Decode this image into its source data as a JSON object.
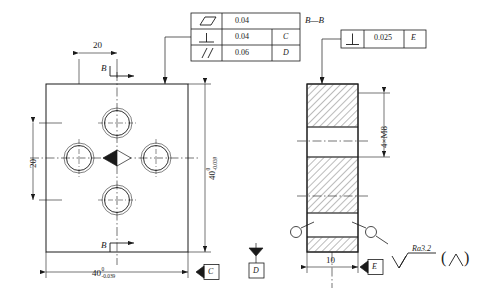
{
  "drawing": {
    "title": "Plate with 4 threaded holes - GD&T detail",
    "line_color": "#1a1a1a",
    "hatch_color": "#1a1a1a"
  },
  "gdt_table": {
    "rows": [
      {
        "symbol": "flatness-parallelogram",
        "tolerance": "0.04",
        "datum": ""
      },
      {
        "symbol": "perpendicularity",
        "tolerance": "0.04",
        "datum": "C"
      },
      {
        "symbol": "parallelism",
        "tolerance": "0.06",
        "datum": "D"
      }
    ]
  },
  "section_frame": {
    "label": "B—B",
    "symbol": "perpendicularity",
    "tolerance": "0.025",
    "datum": "E"
  },
  "front_view": {
    "dim_top": "20",
    "dim_left": "20",
    "dim_right_value": "40",
    "dim_right_upper": "0",
    "dim_right_lower": "-0.039",
    "dim_bottom_value": "40",
    "dim_bottom_upper": "0",
    "dim_bottom_lower": "-0.039",
    "section_mark_top": "B",
    "section_mark_bottom": "B",
    "datum_bottom_right": "D",
    "datum_bottom": "C"
  },
  "section_view": {
    "thread_callout": "4×M8",
    "dim_width": "10",
    "datum": "E"
  },
  "surface_finish": {
    "value": "Ra3.2",
    "bracket_open": "(",
    "bracket_close": ")"
  }
}
